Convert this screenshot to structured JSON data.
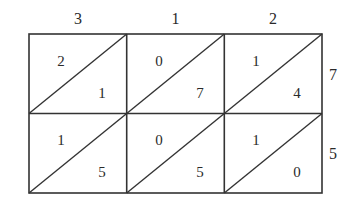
{
  "diagram": {
    "type": "lattice-multiplication",
    "multiplicand_digits": [
      "3",
      "1",
      "2"
    ],
    "multiplier_digits": [
      "7",
      "5"
    ],
    "cells": [
      [
        {
          "tens": "2",
          "ones": "1"
        },
        {
          "tens": "0",
          "ones": "7"
        },
        {
          "tens": "1",
          "ones": "4"
        }
      ],
      [
        {
          "tens": "1",
          "ones": "5"
        },
        {
          "tens": "0",
          "ones": "5"
        },
        {
          "tens": "1",
          "ones": "0"
        }
      ]
    ],
    "colors": {
      "line": "#333333",
      "text": "#2a2a2a",
      "background": "#ffffff"
    }
  }
}
